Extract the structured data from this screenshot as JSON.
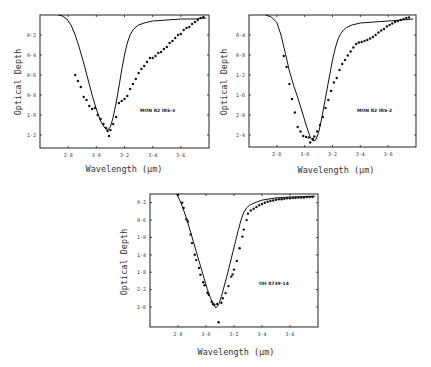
{
  "chart_data": [
    {
      "type": "scatter",
      "title": "",
      "annotation": "MON R2 IRS-3",
      "xlabel": "Wavelength (μm)",
      "ylabel": "Optical Depth",
      "xlim": [
        2.6,
        3.8
      ],
      "ylim": [
        1.33,
        0.0
      ],
      "y_inverted": true,
      "grid": false,
      "xticks": [
        "2·8",
        "3·0",
        "3·2",
        "3·4",
        "3·6"
      ],
      "xtick_values": [
        2.8,
        3.0,
        3.2,
        3.4,
        3.6
      ],
      "yticks": [
        "0·2",
        "0·4",
        "0·6",
        "0·8",
        "1·0",
        "1·2"
      ],
      "ytick_values": [
        0.2,
        0.4,
        0.6,
        0.8,
        1.0,
        1.2
      ],
      "series": [
        {
          "name": "model",
          "style": "line",
          "x": [
            2.73,
            2.76,
            2.79,
            2.82,
            2.85,
            2.88,
            2.91,
            2.94,
            2.97,
            3.0,
            3.03,
            3.06,
            3.08,
            3.1,
            3.12,
            3.14,
            3.16,
            3.18,
            3.2,
            3.22,
            3.24,
            3.26,
            3.28,
            3.3,
            3.34,
            3.4,
            3.5,
            3.6,
            3.7,
            3.78
          ],
          "y": [
            0.0,
            0.01,
            0.04,
            0.1,
            0.2,
            0.33,
            0.48,
            0.64,
            0.8,
            0.94,
            1.06,
            1.13,
            1.15,
            1.12,
            1.02,
            0.88,
            0.72,
            0.55,
            0.4,
            0.28,
            0.2,
            0.15,
            0.12,
            0.1,
            0.08,
            0.06,
            0.05,
            0.04,
            0.04,
            0.03
          ]
        },
        {
          "name": "observed",
          "style": "points",
          "x": [
            2.85,
            2.87,
            2.89,
            2.91,
            2.93,
            2.95,
            2.97,
            2.99,
            3.01,
            3.03,
            3.05,
            3.07,
            3.08,
            3.09,
            3.1,
            3.12,
            3.14,
            3.16,
            3.18,
            3.2,
            3.22,
            3.24,
            3.26,
            3.28,
            3.3,
            3.32,
            3.34,
            3.36,
            3.38,
            3.4,
            3.42,
            3.44,
            3.46,
            3.48,
            3.5,
            3.52,
            3.54,
            3.56,
            3.58,
            3.6,
            3.62,
            3.64,
            3.66,
            3.68,
            3.7,
            3.72,
            3.74,
            3.76
          ],
          "y": [
            0.6,
            0.66,
            0.72,
            0.82,
            0.85,
            0.91,
            0.94,
            0.93,
            1.0,
            1.04,
            1.09,
            1.13,
            1.16,
            1.21,
            1.15,
            1.09,
            1.02,
            0.88,
            0.86,
            0.84,
            0.81,
            0.74,
            0.69,
            0.64,
            0.58,
            0.54,
            0.51,
            0.47,
            0.43,
            0.43,
            0.41,
            0.38,
            0.37,
            0.34,
            0.32,
            0.28,
            0.26,
            0.23,
            0.2,
            0.19,
            0.15,
            0.13,
            0.12,
            0.09,
            0.07,
            0.05,
            0.03,
            0.02
          ]
        }
      ],
      "frame_px": [
        40,
        15,
        209,
        148
      ]
    },
    {
      "type": "scatter",
      "title": "",
      "annotation": "MON R2 IRS-2",
      "xlabel": "Wavelength (μm)",
      "ylabel": "Optical Depth",
      "xlim": [
        2.6,
        3.8
      ],
      "ylim": [
        2.64,
        0.0
      ],
      "y_inverted": true,
      "grid": false,
      "xticks": [
        "2·8",
        "3·0",
        "3·2",
        "3·4",
        "3·6"
      ],
      "xtick_values": [
        2.8,
        3.0,
        3.2,
        3.4,
        3.6
      ],
      "yticks": [
        "0·4",
        "0·8",
        "1·2",
        "1·6",
        "2·0",
        "2·4"
      ],
      "ytick_values": [
        0.4,
        0.8,
        1.2,
        1.6,
        2.0,
        2.4
      ],
      "series": [
        {
          "name": "model",
          "style": "line",
          "x": [
            2.72,
            2.76,
            2.8,
            2.83,
            2.86,
            2.89,
            2.92,
            2.95,
            2.98,
            3.01,
            3.04,
            3.06,
            3.08,
            3.1,
            3.12,
            3.14,
            3.16,
            3.18,
            3.2,
            3.22,
            3.24,
            3.26,
            3.28,
            3.3,
            3.34,
            3.4,
            3.5,
            3.6,
            3.7,
            3.78
          ],
          "y": [
            0.0,
            0.04,
            0.15,
            0.4,
            0.75,
            1.12,
            1.4,
            1.65,
            1.92,
            2.2,
            2.44,
            2.52,
            2.5,
            2.35,
            2.1,
            1.8,
            1.5,
            1.2,
            0.9,
            0.66,
            0.48,
            0.37,
            0.3,
            0.25,
            0.2,
            0.16,
            0.14,
            0.12,
            0.1,
            0.08
          ]
        },
        {
          "name": "observed",
          "style": "points",
          "x": [
            2.85,
            2.87,
            2.89,
            2.91,
            2.93,
            2.95,
            2.97,
            2.99,
            3.01,
            3.03,
            3.04,
            3.06,
            3.07,
            3.09,
            3.11,
            3.13,
            3.15,
            3.17,
            3.19,
            3.21,
            3.23,
            3.25,
            3.27,
            3.29,
            3.31,
            3.33,
            3.35,
            3.37,
            3.39,
            3.41,
            3.43,
            3.45,
            3.47,
            3.49,
            3.51,
            3.53,
            3.55,
            3.57,
            3.59,
            3.61,
            3.63,
            3.65,
            3.67,
            3.69,
            3.71,
            3.73,
            3.75
          ],
          "y": [
            0.82,
            1.04,
            1.38,
            1.68,
            1.95,
            2.24,
            2.33,
            2.42,
            2.44,
            2.45,
            2.55,
            2.48,
            2.43,
            2.33,
            2.2,
            2.04,
            1.86,
            1.7,
            1.52,
            1.35,
            1.26,
            1.1,
            0.98,
            0.9,
            0.81,
            0.73,
            0.65,
            0.58,
            0.55,
            0.54,
            0.52,
            0.5,
            0.47,
            0.44,
            0.4,
            0.35,
            0.31,
            0.28,
            0.23,
            0.2,
            0.17,
            0.14,
            0.12,
            0.1,
            0.08,
            0.06,
            0.05
          ]
        }
      ],
      "frame_px": [
        249,
        15,
        416,
        147
      ]
    },
    {
      "type": "scatter",
      "title": "",
      "annotation": "OH 0739-14",
      "xlabel": "Wavelength (μm)",
      "ylabel": "Optical Depth",
      "xlim": [
        2.6,
        3.8
      ],
      "ylim": [
        3.06,
        0.0
      ],
      "y_inverted": true,
      "grid": false,
      "xticks": [
        "2·8",
        "3·0",
        "3·2",
        "3·4",
        "3·6"
      ],
      "xtick_values": [
        2.8,
        3.0,
        3.2,
        3.4,
        3.6
      ],
      "yticks": [
        "0·2",
        "0·6",
        "1·0",
        "1·4",
        "1·8",
        "2·2",
        "2·6"
      ],
      "ytick_values": [
        0.2,
        0.6,
        1.0,
        1.4,
        1.8,
        2.2,
        2.6
      ],
      "series": [
        {
          "name": "model",
          "style": "line",
          "x": [
            2.79,
            2.81,
            2.83,
            2.85,
            2.87,
            2.89,
            2.91,
            2.93,
            2.95,
            2.97,
            2.99,
            3.01,
            3.03,
            3.05,
            3.07,
            3.09,
            3.11,
            3.13,
            3.15,
            3.17,
            3.19,
            3.21,
            3.23,
            3.25,
            3.27,
            3.29,
            3.31,
            3.35,
            3.4,
            3.5,
            3.6,
            3.7,
            3.78
          ],
          "y": [
            0.0,
            0.12,
            0.28,
            0.46,
            0.66,
            0.88,
            1.1,
            1.32,
            1.54,
            1.76,
            1.98,
            2.2,
            2.38,
            2.52,
            2.62,
            2.55,
            2.36,
            2.12,
            1.88,
            1.62,
            1.36,
            1.1,
            0.84,
            0.6,
            0.42,
            0.32,
            0.26,
            0.2,
            0.14,
            0.09,
            0.07,
            0.06,
            0.05
          ]
        },
        {
          "name": "observed",
          "style": "points",
          "x": [
            2.8,
            2.83,
            2.84,
            2.86,
            2.87,
            2.89,
            2.9,
            2.92,
            2.93,
            2.95,
            2.96,
            2.98,
            2.99,
            3.01,
            3.02,
            3.04,
            3.05,
            3.06,
            3.08,
            3.09,
            3.11,
            3.12,
            3.14,
            3.16,
            3.18,
            3.19,
            3.2,
            3.22,
            3.24,
            3.26,
            3.27,
            3.29,
            3.3,
            3.32,
            3.34,
            3.36,
            3.38,
            3.4,
            3.42,
            3.44,
            3.46,
            3.48,
            3.5,
            3.52,
            3.54,
            3.56,
            3.58,
            3.6,
            3.62,
            3.64,
            3.66,
            3.68,
            3.7,
            3.72,
            3.74,
            3.76
          ],
          "y": [
            0.02,
            0.2,
            0.32,
            0.58,
            0.63,
            0.93,
            1.13,
            1.4,
            1.52,
            1.7,
            1.86,
            2.03,
            2.1,
            2.27,
            2.32,
            2.48,
            2.53,
            2.55,
            2.53,
            2.95,
            2.5,
            2.4,
            2.28,
            2.12,
            1.9,
            1.85,
            1.74,
            1.54,
            1.25,
            0.98,
            0.82,
            0.6,
            0.45,
            0.38,
            0.34,
            0.3,
            0.26,
            0.23,
            0.2,
            0.18,
            0.16,
            0.15,
            0.13,
            0.12,
            0.12,
            0.11,
            0.1,
            0.1,
            0.09,
            0.09,
            0.08,
            0.08,
            0.08,
            0.07,
            0.07,
            0.07
          ]
        }
      ],
      "frame_px": [
        150,
        194,
        318,
        327
      ]
    }
  ],
  "panels": {
    "top_left": {
      "annotation": "MON R2 IRS-3",
      "xlabel": "Wavelength (μm)",
      "ylabel": "Optical Depth"
    },
    "top_right": {
      "annotation": "MON R2 IRS-2",
      "xlabel": "Wavelength (μm)",
      "ylabel": "Optical Depth"
    },
    "bottom": {
      "annotation": "OH 0739-14",
      "xlabel": "Wavelength (μm)",
      "ylabel": "Optical Depth"
    }
  }
}
